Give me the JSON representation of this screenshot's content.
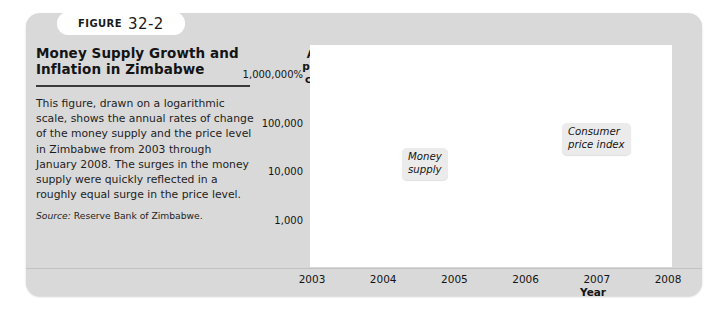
{
  "figure": {
    "tab_word": "FIGURE",
    "tab_number": "32-2",
    "title": "Money Supply Growth and Inflation in Zimbabwe",
    "body": "This figure, drawn on a logarithmic scale, shows the annual rates of change of the money supply and the price level in Zimbabwe from 2003 through January 2008. The surges in the money supply were quickly reflected in a roughly equal surge in the price level.",
    "source_label": "Source:",
    "source_text": " Reserve Bank of Zimbabwe."
  },
  "colors": {
    "panel": "#d9d9d9",
    "plot_background": "#ffffff",
    "money_supply_line": "#6e6e6e",
    "cpi_line": "#9e9e9e",
    "axis": "#3a3a3a",
    "callout_background": "#ebebeb"
  },
  "chart_data": {
    "type": "line",
    "title": "Money Supply Growth and Inflation in Zimbabwe",
    "xlabel": "Year",
    "ylabel": "Annual percent change",
    "ylabel_lines": [
      "Annual",
      "percent",
      "change"
    ],
    "yscale": "log",
    "y_tick_labels": [
      "1,000,000%",
      "100,000",
      "10,000",
      "1,000"
    ],
    "y_tick_values": [
      1000000,
      100000,
      10000,
      1000
    ],
    "ylim": [
      300,
      3000000
    ],
    "y_axis_break": true,
    "grid": false,
    "legend_position": "inline-callouts",
    "x_tick_labels": [
      "2003",
      "2004",
      "2005",
      "2006",
      "2007",
      "2008"
    ],
    "x_tick_values": [
      2003,
      2004,
      2005,
      2006,
      2007,
      2008
    ],
    "xlim": [
      2003,
      2008
    ],
    "annotations": [
      {
        "text": "Money\nsupply",
        "series": "Money supply",
        "x": 2004.4,
        "y": 30000
      },
      {
        "text": "Consumer\nprice index",
        "series": "Consumer price index",
        "x": 2006.6,
        "y": 260000
      }
    ],
    "series": [
      {
        "name": "Money supply",
        "color": "#6e6e6e",
        "x": [
          2003.0,
          2003.2,
          2003.4,
          2003.6,
          2003.8,
          2004.0,
          2004.2,
          2004.4,
          2004.6,
          2004.8,
          2005.0,
          2005.2,
          2005.4,
          2005.6,
          2005.8,
          2006.0,
          2006.2,
          2006.4,
          2006.6,
          2006.8,
          2007.0,
          2007.2,
          2007.4,
          2007.6,
          2007.8,
          2008.0
        ],
        "values": [
          430,
          470,
          560,
          700,
          900,
          1050,
          1150,
          1100,
          900,
          700,
          540,
          470,
          455,
          470,
          560,
          760,
          950,
          1050,
          1150,
          1600,
          2600,
          6500,
          11000,
          13000,
          28000,
          110000
        ]
      },
      {
        "name": "Consumer price index",
        "color": "#9e9e9e",
        "x": [
          2003.0,
          2003.2,
          2003.4,
          2003.6,
          2003.8,
          2004.0,
          2004.2,
          2004.4,
          2004.6,
          2004.8,
          2005.0,
          2005.2,
          2005.4,
          2005.6,
          2005.8,
          2006.0,
          2006.2,
          2006.4,
          2006.6,
          2006.8,
          2007.0,
          2007.2,
          2007.4,
          2007.6,
          2007.8,
          2008.0
        ],
        "values": [
          400,
          520,
          640,
          800,
          950,
          1080,
          1180,
          1150,
          1000,
          880,
          830,
          800,
          830,
          860,
          900,
          930,
          1100,
          1400,
          1700,
          2300,
          3400,
          8000,
          16000,
          17000,
          30000,
          100000
        ]
      }
    ]
  }
}
